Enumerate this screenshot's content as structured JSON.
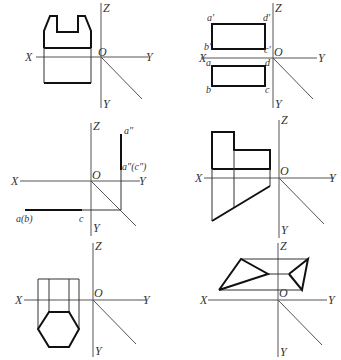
{
  "figure": {
    "panels": [
      {
        "id": "panel-1",
        "axes": {
          "x": "X",
          "y_right": "Y",
          "z": "Z",
          "origin": "O",
          "y_down": "Y"
        },
        "point_labels": []
      },
      {
        "id": "panel-2",
        "axes": {
          "x": "X",
          "y_right": "Y",
          "z": "Z",
          "origin": "O",
          "y_down": "Y"
        },
        "point_labels": {
          "a_prime": "a′",
          "d_prime": "d′",
          "b_prime": "b′",
          "c_prime": "c′",
          "a": "a",
          "d": "d",
          "b": "b",
          "c": "c"
        }
      },
      {
        "id": "panel-3",
        "axes": {
          "x": "X",
          "y_right": "Y",
          "z": "Z",
          "origin": "O",
          "y_down": "Y"
        },
        "point_labels": {
          "a_dprime": "a″",
          "a_c_dprime": "a″(c″)",
          "a_b": "a(b)",
          "c": "c"
        }
      },
      {
        "id": "panel-4",
        "axes": {
          "x": "X",
          "y_right": "Y",
          "z": "Z",
          "origin": "O",
          "y_down": "Y"
        },
        "point_labels": []
      },
      {
        "id": "panel-5",
        "axes": {
          "x": "X",
          "y_right": "Y",
          "z": "Z",
          "origin": "O",
          "y_down": "Y"
        },
        "point_labels": []
      },
      {
        "id": "panel-6",
        "axes": {
          "x": "X",
          "y_right": "Y",
          "z": "Z",
          "origin": "O",
          "y_down": "Y"
        },
        "point_labels": []
      }
    ]
  }
}
